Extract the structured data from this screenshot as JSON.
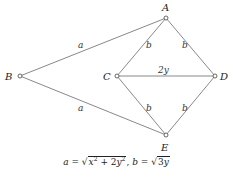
{
  "diagram": {
    "nodes": [
      {
        "id": "A",
        "label": "A",
        "x": 166,
        "y": 18,
        "label_x": 163,
        "label_y": 11
      },
      {
        "id": "B",
        "label": "B",
        "x": 20,
        "y": 76,
        "label_x": 5,
        "label_y": 80
      },
      {
        "id": "C",
        "label": "C",
        "x": 117,
        "y": 76,
        "label_x": 103,
        "label_y": 80
      },
      {
        "id": "D",
        "label": "D",
        "x": 215,
        "y": 76,
        "label_x": 221,
        "label_y": 80
      },
      {
        "id": "E",
        "label": "E",
        "x": 166,
        "y": 135,
        "label_x": 162,
        "label_y": 151
      }
    ],
    "edges": [
      {
        "from": "B",
        "to": "A",
        "label": "a",
        "label_x": 78,
        "label_y": 48
      },
      {
        "from": "B",
        "to": "E",
        "label": "a",
        "label_x": 78,
        "label_y": 111
      },
      {
        "from": "C",
        "to": "A",
        "label": "b",
        "label_x": 146,
        "label_y": 48
      },
      {
        "from": "A",
        "to": "D",
        "label": "b",
        "label_x": 182,
        "label_y": 48
      },
      {
        "from": "C",
        "to": "D",
        "label": "2y",
        "label_x": 160,
        "label_y": 73
      },
      {
        "from": "C",
        "to": "E",
        "label": "b",
        "label_x": 146,
        "label_y": 111
      },
      {
        "from": "E",
        "to": "D",
        "label": "b",
        "label_x": 182,
        "label_y": 111
      }
    ]
  },
  "formula": {
    "a_var": "a",
    "eq1": " = ",
    "radicand_1": "x",
    "exp_1": "2",
    "plus": " + 2",
    "radicand_2": "y",
    "exp_2": "2",
    "sep": ", ",
    "b_var": "b",
    "eq2": " = ",
    "radicand_3": "3",
    "radicand_3_var": "y"
  }
}
